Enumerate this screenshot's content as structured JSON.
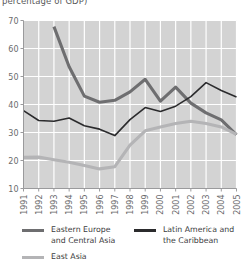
{
  "title_clipped": "percentage of GDP)",
  "chart_data": {
    "type": "line",
    "title": "percentage of GDP)",
    "xlabel": "",
    "ylabel": "",
    "ylim": [
      10,
      70
    ],
    "yticks": [
      10,
      20,
      30,
      40,
      50,
      60,
      70
    ],
    "grid": true,
    "legend_position": "bottom",
    "categories": [
      1991,
      1992,
      1993,
      1994,
      1995,
      1996,
      1997,
      1998,
      1999,
      2000,
      2001,
      2002,
      2003,
      2004,
      2005
    ],
    "x": [
      "1991",
      "1992",
      "1993",
      "1994",
      "1995",
      "1996",
      "1997",
      "1998",
      "1999",
      "2000",
      "2001",
      "2002",
      "2003",
      "2004",
      "2005"
    ],
    "series": [
      {
        "name": "Eastern Europe and Central Asia",
        "color": "#6e6e70",
        "width": 3.1,
        "values": [
          null,
          null,
          67.8,
          53.5,
          43.0,
          40.8,
          41.5,
          44.5,
          49.0,
          41.2,
          46.2,
          40.5,
          37.0,
          34.5,
          29.2
        ]
      },
      {
        "name": "Latin America and the Caribbean",
        "color": "#2b2b2d",
        "width": 1.6,
        "values": [
          37.8,
          34.3,
          34.0,
          35.2,
          32.4,
          31.2,
          28.9,
          34.6,
          38.9,
          37.5,
          39.4,
          42.8,
          47.8,
          45.0,
          42.7
        ]
      },
      {
        "name": "East Asia",
        "color": "#b4b4b6",
        "width": 3.1,
        "values": [
          21.1,
          21.2,
          20.3,
          19.4,
          18.2,
          17.0,
          17.8,
          25.5,
          30.6,
          32.0,
          33.2,
          34.0,
          33.2,
          32.0,
          29.3
        ]
      }
    ]
  },
  "legend": [
    {
      "label": "Eastern Europe\nand Central Asia",
      "color": "#6e6e70",
      "key": "eastern-europe"
    },
    {
      "label": "Latin America and\nthe Caribbean",
      "color": "#2b2b2d",
      "key": "latin-america"
    },
    {
      "label": "East Asia",
      "color": "#b4b4b6",
      "key": "east-asia"
    }
  ],
  "style": {
    "plot_background": "#d3d3d3",
    "gridline_color": "#ffffff",
    "axis_color": "#9a9a9c",
    "tick_text_color": "#6a6a6c"
  }
}
